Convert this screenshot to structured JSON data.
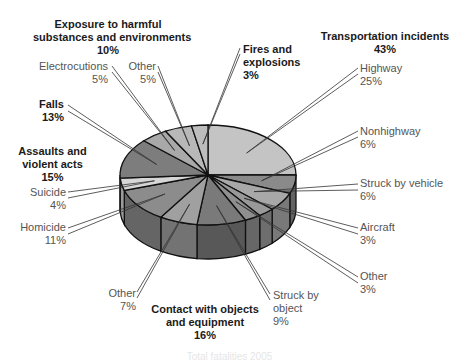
{
  "chart_data": {
    "type": "pie",
    "style": "3d-exploded-labels",
    "title": "",
    "categories_order": "clockwise from 12 o'clock",
    "slices": [
      {
        "group": "Transportation incidents",
        "label": "Highway",
        "value": 25,
        "color": "#c4c4c4"
      },
      {
        "group": "Transportation incidents",
        "label": "Nonhighway",
        "value": 6,
        "color": "#8a8a8a"
      },
      {
        "group": "Transportation incidents",
        "label": "Struck by vehicle",
        "value": 6,
        "color": "#a8a8a8"
      },
      {
        "group": "Transportation incidents",
        "label": "Aircraft",
        "value": 3,
        "color": "#999999"
      },
      {
        "group": "Transportation incidents",
        "label": "Other",
        "value": 3,
        "color": "#8f8f8f"
      },
      {
        "group": "Contact with objects and equipment",
        "label": "Struck by object",
        "value": 9,
        "color": "#7a7a7a"
      },
      {
        "group": "Contact with objects and equipment",
        "label": "Other",
        "value": 7,
        "color": "#a0a0a0"
      },
      {
        "group": "Assaults and violent acts",
        "label": "Homicide",
        "value": 11,
        "color": "#8c8c8c"
      },
      {
        "group": "Assaults and violent acts",
        "label": "Suicide",
        "value": 4,
        "color": "#d6d6d6"
      },
      {
        "group": "Falls",
        "label": "Falls",
        "value": 13,
        "color": "#7d7d7d"
      },
      {
        "group": "Exposure to harmful substances and environments",
        "label": "Electrocutions",
        "value": 5,
        "color": "#a9a9a9"
      },
      {
        "group": "Exposure to harmful substances and environments",
        "label": "Other",
        "value": 5,
        "color": "#b8b8b8"
      },
      {
        "group": "Fires and explosions",
        "label": "Fires and explosions",
        "value": 3,
        "color": "#bdbdbd"
      }
    ],
    "groups": [
      {
        "name": "Transportation incidents",
        "value": 43
      },
      {
        "name": "Contact with objects and equipment",
        "value": 16
      },
      {
        "name": "Assaults and violent acts",
        "value": 15
      },
      {
        "name": "Falls",
        "value": 13
      },
      {
        "name": "Exposure to harmful substances and environments",
        "value": 10
      },
      {
        "name": "Fires and explosions",
        "value": 3
      }
    ],
    "legend": "none (callout labels)"
  },
  "labels": {
    "exposure": {
      "line1": "Exposure to harmful",
      "line2": "substances and environments",
      "pct": "10%"
    },
    "electrocutions": {
      "name": "Electrocutions",
      "pct": "5%"
    },
    "exposure_other": {
      "name": "Other",
      "pct": "5%"
    },
    "fires": {
      "line1": "Fires and",
      "line2": "explosions",
      "pct": "3%"
    },
    "transport": {
      "name": "Transportation incidents",
      "pct": "43%"
    },
    "highway": {
      "name": "Highway",
      "pct": "25%"
    },
    "nonhighway": {
      "name": "Nonhighway",
      "pct": "6%"
    },
    "struck_vehicle": {
      "name": "Struck by vehicle",
      "pct": "6%"
    },
    "aircraft": {
      "name": "Aircraft",
      "pct": "3%"
    },
    "transport_other": {
      "name": "Other",
      "pct": "3%"
    },
    "falls": {
      "name": "Falls",
      "pct": "13%"
    },
    "assaults": {
      "line1": "Assaults and",
      "line2": "violent acts",
      "pct": "15%"
    },
    "suicide": {
      "name": "Suicide",
      "pct": "4%"
    },
    "homicide": {
      "name": "Homicide",
      "pct": "11%"
    },
    "contact_other": {
      "name": "Other",
      "pct": "7%"
    },
    "struck_object": {
      "line1": "Struck by",
      "line2": "object",
      "pct": "9%"
    },
    "contact": {
      "line1": "Contact with objects",
      "line2": "and equipment",
      "pct": "16%"
    }
  },
  "caption": "Total fatalities 2005"
}
